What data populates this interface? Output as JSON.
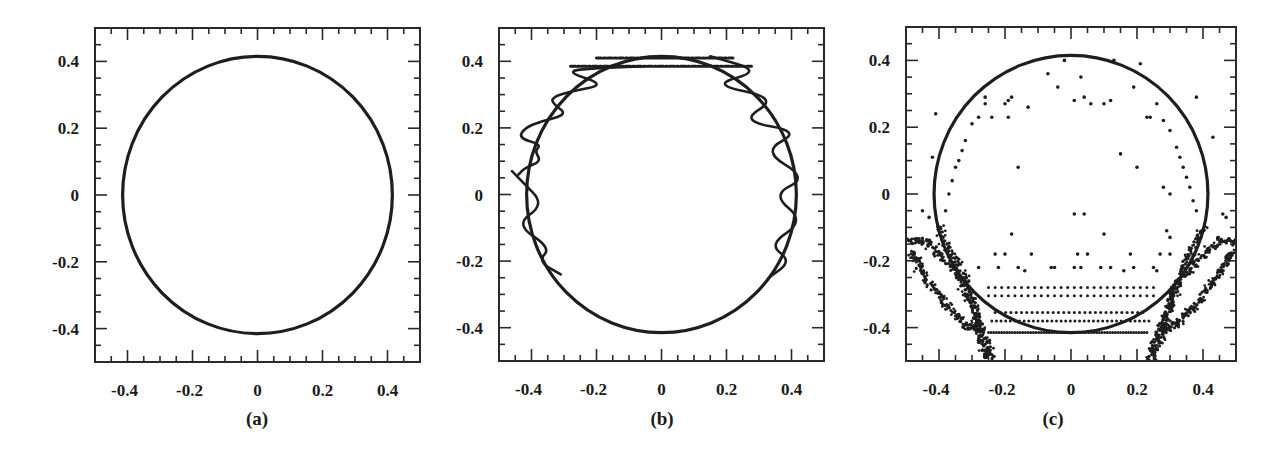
{
  "chart_data": [
    {
      "id": "a",
      "type": "scatter",
      "panel_label": "(a)",
      "title": "",
      "xlabel": "",
      "ylabel": "",
      "xlim": [
        -0.5,
        0.5
      ],
      "ylim": [
        -0.5,
        0.5
      ],
      "grid": false,
      "legend": null,
      "x_tick_labels": [
        "-0.4",
        "-0.2",
        "0",
        "0.2",
        "0.4"
      ],
      "y_tick_labels": [
        "0.4",
        "0.2",
        "0",
        "-0.2",
        "-0.4"
      ],
      "x_ticks": [
        -0.4,
        -0.2,
        0,
        0.2,
        0.4
      ],
      "y_ticks": [
        0.4,
        0.2,
        0,
        -0.2,
        -0.4
      ],
      "minor_tick_step": 0.05,
      "series": [
        {
          "name": "circle",
          "kind": "circle",
          "center": [
            0,
            0
          ],
          "radius": 0.415
        }
      ],
      "frame_px": {
        "left": 95,
        "top": 28,
        "right": 420,
        "bottom": 362
      }
    },
    {
      "id": "b",
      "type": "line",
      "panel_label": "(b)",
      "title": "",
      "xlabel": "",
      "ylabel": "",
      "xlim": [
        -0.5,
        0.5
      ],
      "ylim": [
        -0.5,
        0.5
      ],
      "grid": false,
      "legend": null,
      "x_tick_labels": [
        "-0.4",
        "-0.2",
        "0",
        "0.2",
        "0.4"
      ],
      "y_tick_labels": [
        "0.4",
        "0.2",
        "0",
        "-0.2",
        "-0.4"
      ],
      "x_ticks": [
        -0.4,
        -0.2,
        0,
        0.2,
        0.4
      ],
      "y_ticks": [
        0.4,
        0.2,
        0,
        -0.2,
        -0.4
      ],
      "minor_tick_step": 0.05,
      "series": [
        {
          "name": "circle",
          "kind": "circle",
          "center": [
            0,
            0
          ],
          "radius": 0.415
        },
        {
          "name": "right-oscillation",
          "kind": "path",
          "points": [
            [
              0.15,
              0.415
            ],
            [
              0.31,
              0.37
            ],
            [
              0.15,
              0.33
            ],
            [
              0.36,
              0.29
            ],
            [
              0.24,
              0.22
            ],
            [
              0.43,
              0.19
            ],
            [
              0.31,
              0.13
            ],
            [
              0.45,
              0.05
            ],
            [
              0.34,
              -0.0
            ],
            [
              0.44,
              -0.08
            ],
            [
              0.33,
              -0.15
            ],
            [
              0.4,
              -0.2
            ],
            [
              0.33,
              -0.25
            ]
          ]
        },
        {
          "name": "left-oscillation",
          "kind": "path",
          "points": [
            [
              -0.46,
              0.07
            ],
            [
              -0.43,
              0.04
            ],
            [
              -0.36,
              -0.03
            ],
            [
              -0.45,
              -0.09
            ],
            [
              -0.34,
              -0.16
            ],
            [
              -0.38,
              -0.2
            ],
            [
              -0.31,
              -0.24
            ]
          ]
        },
        {
          "name": "left-noisy",
          "kind": "path",
          "points": [
            [
              -0.44,
              0.06
            ],
            [
              -0.42,
              0.08
            ],
            [
              -0.37,
              0.1
            ],
            [
              -0.39,
              0.13
            ],
            [
              -0.37,
              0.15
            ],
            [
              -0.44,
              0.17
            ],
            [
              -0.42,
              0.2
            ],
            [
              -0.37,
              0.22
            ],
            [
              -0.29,
              0.24
            ],
            [
              -0.33,
              0.27
            ],
            [
              -0.34,
              0.29
            ],
            [
              -0.28,
              0.31
            ],
            [
              -0.17,
              0.33
            ],
            [
              -0.3,
              0.37
            ],
            [
              -0.2,
              0.38
            ],
            [
              -0.05,
              0.385
            ]
          ]
        },
        {
          "name": "top-band-upper",
          "kind": "dashed",
          "points": [
            [
              -0.2,
              0.41
            ],
            [
              0.22,
              0.41
            ]
          ]
        },
        {
          "name": "top-band-lower",
          "kind": "dashed",
          "points": [
            [
              -0.28,
              0.385
            ],
            [
              0.28,
              0.385
            ]
          ]
        }
      ],
      "frame_px": {
        "left": 499,
        "top": 28,
        "right": 824,
        "bottom": 361
      }
    },
    {
      "id": "c",
      "type": "scatter",
      "panel_label": "(c)",
      "title": "",
      "xlabel": "",
      "ylabel": "",
      "xlim": [
        -0.5,
        0.5
      ],
      "ylim": [
        -0.5,
        0.5
      ],
      "grid": false,
      "legend": null,
      "x_tick_labels": [
        "-0.4",
        "-0.2",
        "0",
        "0.2",
        "0.4"
      ],
      "y_tick_labels": [
        "0.4",
        "0.2",
        "0",
        "-0.2",
        "-0.4"
      ],
      "x_ticks": [
        -0.4,
        -0.2,
        0,
        0.2,
        0.4
      ],
      "y_ticks": [
        0.4,
        0.2,
        0,
        -0.2,
        -0.4
      ],
      "minor_tick_step": 0.05,
      "series": [
        {
          "name": "circle",
          "kind": "circle",
          "center": [
            0,
            0
          ],
          "radius": 0.415
        },
        {
          "name": "scattered-points",
          "kind": "points",
          "points": [
            [
              -0.02,
              0.4
            ],
            [
              0.13,
              0.4
            ],
            [
              0.21,
              0.39
            ],
            [
              -0.07,
              0.36
            ],
            [
              0.03,
              0.35
            ],
            [
              -0.04,
              0.32
            ],
            [
              0.19,
              0.32
            ],
            [
              0.01,
              0.28
            ],
            [
              0.04,
              0.29
            ],
            [
              0.06,
              0.27
            ],
            [
              0.1,
              0.27
            ],
            [
              0.12,
              0.28
            ],
            [
              -0.13,
              0.26
            ],
            [
              -0.26,
              0.29
            ],
            [
              -0.26,
              0.27
            ],
            [
              -0.19,
              0.28
            ],
            [
              -0.18,
              0.29
            ],
            [
              -0.2,
              0.27
            ],
            [
              -0.24,
              0.23
            ],
            [
              -0.28,
              0.23
            ],
            [
              -0.3,
              0.21
            ],
            [
              -0.19,
              0.23
            ],
            [
              0.26,
              0.27
            ],
            [
              0.23,
              0.23
            ],
            [
              0.24,
              0.23
            ],
            [
              0.28,
              0.22
            ],
            [
              0.3,
              0.19
            ],
            [
              0.38,
              0.29
            ],
            [
              -0.41,
              0.24
            ],
            [
              -0.32,
              0.16
            ],
            [
              -0.33,
              0.13
            ],
            [
              -0.34,
              0.1
            ],
            [
              -0.35,
              0.08
            ],
            [
              -0.36,
              0.04
            ],
            [
              -0.37,
              0.0
            ],
            [
              -0.38,
              -0.05
            ],
            [
              -0.42,
              0.11
            ],
            [
              0.32,
              0.14
            ],
            [
              0.33,
              0.11
            ],
            [
              0.34,
              0.08
            ],
            [
              0.35,
              0.05
            ],
            [
              0.36,
              0.02
            ],
            [
              0.37,
              -0.02
            ],
            [
              0.38,
              -0.05
            ],
            [
              0.15,
              0.12
            ],
            [
              0.2,
              0.08
            ],
            [
              -0.16,
              0.08
            ],
            [
              0.28,
              0.02
            ],
            [
              0.3,
              0.0
            ],
            [
              0.43,
              0.17
            ],
            [
              0.01,
              -0.06
            ],
            [
              0.04,
              -0.06
            ],
            [
              -0.18,
              -0.12
            ],
            [
              0.1,
              -0.12
            ],
            [
              0.29,
              -0.11
            ],
            [
              0.3,
              -0.13
            ],
            [
              -0.2,
              -0.18
            ],
            [
              -0.23,
              -0.18
            ],
            [
              -0.12,
              -0.18
            ],
            [
              0.02,
              -0.18
            ],
            [
              0.05,
              -0.18
            ],
            [
              0.18,
              -0.18
            ],
            [
              0.27,
              -0.18
            ],
            [
              0.3,
              -0.18
            ],
            [
              -0.28,
              -0.22
            ],
            [
              -0.22,
              -0.22
            ],
            [
              -0.16,
              -0.22
            ],
            [
              -0.14,
              -0.23
            ],
            [
              -0.06,
              -0.22
            ],
            [
              -0.05,
              -0.22
            ],
            [
              0.01,
              -0.22
            ],
            [
              0.03,
              -0.22
            ],
            [
              0.09,
              -0.22
            ],
            [
              0.12,
              -0.22
            ],
            [
              0.16,
              -0.23
            ],
            [
              0.19,
              -0.22
            ],
            [
              0.25,
              -0.22
            ],
            [
              0.26,
              -0.23
            ],
            [
              -0.45,
              -0.05
            ],
            [
              -0.43,
              -0.07
            ],
            [
              0.46,
              -0.06
            ],
            [
              0.47,
              -0.07
            ]
          ]
        },
        {
          "name": "row-y-0.28",
          "kind": "row",
          "y": -0.28,
          "x_from": -0.25,
          "x_to": 0.25,
          "step": 0.02
        },
        {
          "name": "row-y-0.305",
          "kind": "row",
          "y": -0.305,
          "x_from": -0.25,
          "x_to": 0.25,
          "step": 0.02
        },
        {
          "name": "row-y-0.355",
          "kind": "row",
          "y": -0.355,
          "x_from": -0.23,
          "x_to": 0.23,
          "step": 0.016
        },
        {
          "name": "row-y-0.38",
          "kind": "row",
          "y": -0.38,
          "x_from": -0.24,
          "x_to": 0.24,
          "step": 0.014
        },
        {
          "name": "row-y-0.415",
          "kind": "row",
          "y": -0.415,
          "x_from": -0.25,
          "x_to": 0.23,
          "step": 0.008
        },
        {
          "name": "left-wing-outer",
          "kind": "band",
          "points": [
            [
              -0.5,
              -0.14
            ],
            [
              -0.44,
              -0.14
            ],
            [
              -0.38,
              -0.2
            ],
            [
              -0.33,
              -0.26
            ],
            [
              -0.3,
              -0.33
            ],
            [
              -0.27,
              -0.41
            ],
            [
              -0.24,
              -0.5
            ]
          ]
        },
        {
          "name": "left-wing-inner",
          "kind": "band",
          "points": [
            [
              -0.48,
              -0.17
            ],
            [
              -0.46,
              -0.22
            ],
            [
              -0.42,
              -0.28
            ],
            [
              -0.37,
              -0.34
            ],
            [
              -0.32,
              -0.39
            ],
            [
              -0.28,
              -0.41
            ]
          ]
        },
        {
          "name": "left-arm",
          "kind": "band",
          "points": [
            [
              -0.4,
              -0.1
            ],
            [
              -0.36,
              -0.18
            ],
            [
              -0.32,
              -0.26
            ],
            [
              -0.29,
              -0.36
            ],
            [
              -0.27,
              -0.44
            ],
            [
              -0.25,
              -0.5
            ]
          ]
        },
        {
          "name": "right-wing-outer",
          "kind": "band",
          "points": [
            [
              0.5,
              -0.14
            ],
            [
              0.45,
              -0.14
            ],
            [
              0.38,
              -0.2
            ],
            [
              0.33,
              -0.26
            ],
            [
              0.3,
              -0.33
            ],
            [
              0.27,
              -0.41
            ],
            [
              0.23,
              -0.5
            ]
          ]
        },
        {
          "name": "right-wing-inner",
          "kind": "band",
          "points": [
            [
              0.49,
              -0.17
            ],
            [
              0.46,
              -0.22
            ],
            [
              0.42,
              -0.28
            ],
            [
              0.37,
              -0.34
            ],
            [
              0.32,
              -0.39
            ],
            [
              0.28,
              -0.41
            ]
          ]
        },
        {
          "name": "right-arm",
          "kind": "band",
          "points": [
            [
              0.4,
              -0.1
            ],
            [
              0.36,
              -0.18
            ],
            [
              0.32,
              -0.26
            ],
            [
              0.29,
              -0.36
            ],
            [
              0.27,
              -0.44
            ],
            [
              0.24,
              -0.5
            ]
          ]
        }
      ],
      "frame_px": {
        "left": 906,
        "top": 27,
        "right": 1236,
        "bottom": 361
      }
    }
  ]
}
